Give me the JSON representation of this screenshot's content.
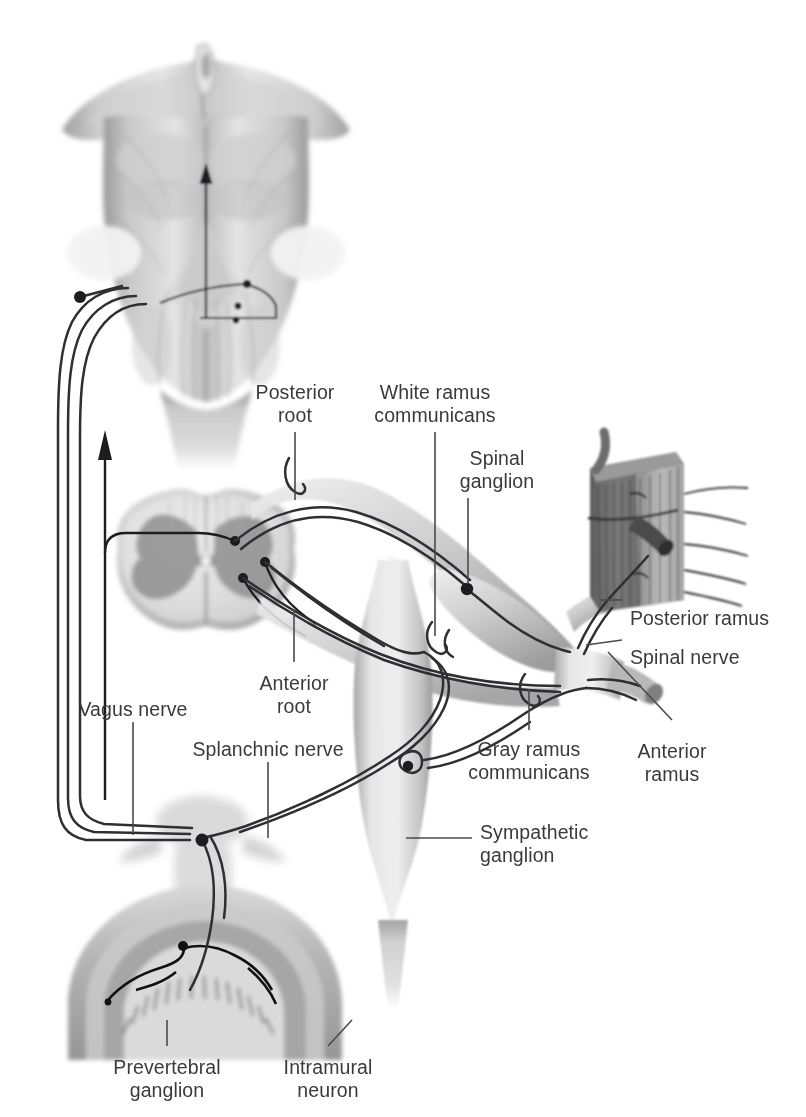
{
  "figure": {
    "background_color": "#ffffff",
    "label_color": "#3a3a3c",
    "leader_color": "#4a4a4c",
    "nerve_color": "#2f2f33",
    "tissue_light": "#dcdcdc",
    "tissue_mid": "#b9b9b9",
    "tissue_dark": "#8a8a8a"
  },
  "labels": [
    {
      "id": "posterior-root",
      "lines": [
        "Posterior",
        "root"
      ],
      "x": 295,
      "y": 381,
      "align": "center"
    },
    {
      "id": "white-ramus",
      "lines": [
        "White ramus",
        "communicans"
      ],
      "x": 435,
      "y": 381,
      "align": "center"
    },
    {
      "id": "spinal-ganglion",
      "lines": [
        "Spinal",
        "ganglion"
      ],
      "x": 497,
      "y": 447,
      "align": "center"
    },
    {
      "id": "posterior-ramus",
      "lines": [
        "Posterior ramus"
      ],
      "x": 630,
      "y": 607,
      "align": "left"
    },
    {
      "id": "spinal-nerve",
      "lines": [
        "Spinal nerve"
      ],
      "x": 630,
      "y": 646,
      "align": "left"
    },
    {
      "id": "anterior-ramus",
      "lines": [
        "Anterior",
        "ramus"
      ],
      "x": 672,
      "y": 740,
      "align": "center"
    },
    {
      "id": "gray-ramus",
      "lines": [
        "Gray ramus",
        "communicans"
      ],
      "x": 529,
      "y": 738,
      "align": "center"
    },
    {
      "id": "sympathetic-ganglion",
      "lines": [
        "Sympathetic",
        "ganglion"
      ],
      "x": 480,
      "y": 821,
      "align": "left"
    },
    {
      "id": "anterior-root",
      "lines": [
        "Anterior",
        "root"
      ],
      "x": 294,
      "y": 672,
      "align": "center"
    },
    {
      "id": "vagus-nerve",
      "lines": [
        "Vagus nerve"
      ],
      "x": 133,
      "y": 698,
      "align": "center"
    },
    {
      "id": "splanchnic-nerve",
      "lines": [
        "Splanchnic nerve"
      ],
      "x": 268,
      "y": 738,
      "align": "center"
    },
    {
      "id": "prevertebral-ganglion",
      "lines": [
        "Prevertebral",
        "ganglion"
      ],
      "x": 167,
      "y": 1056,
      "align": "center"
    },
    {
      "id": "intramural-neuron",
      "lines": [
        "Intramural",
        "neuron"
      ],
      "x": 328,
      "y": 1056,
      "align": "center"
    }
  ],
  "leaders": [
    {
      "id": "leader-posterior-root",
      "points": "295,432 295,500"
    },
    {
      "id": "leader-white-ramus",
      "points": "435,432 435,636"
    },
    {
      "id": "leader-spinal-ganglion",
      "points": "468,498 468,584"
    },
    {
      "id": "leader-posterior-ramus",
      "points": "600,600 622,600"
    },
    {
      "id": "leader-spinal-nerve",
      "points": "586,645 622,640"
    },
    {
      "id": "leader-anterior-ramus",
      "points": "608,652 672,720"
    },
    {
      "id": "leader-gray-ramus",
      "points": "529,689 529,730"
    },
    {
      "id": "leader-sympathetic-ganglion",
      "points": "406,838 472,838"
    },
    {
      "id": "leader-anterior-root",
      "points": "294,610 294,662"
    },
    {
      "id": "leader-vagus-nerve",
      "points": "133,722 133,835"
    },
    {
      "id": "leader-splanchnic-nerve",
      "points": "268,762 268,838"
    },
    {
      "id": "leader-prevertebral-ganglion",
      "points": "167,1020 167,1046"
    },
    {
      "id": "leader-intramural-neuron",
      "points": "352,1020 328,1046"
    }
  ],
  "structures": [
    {
      "id": "brainstem",
      "name": "brainstem-illustration"
    },
    {
      "id": "spinal-cord",
      "name": "spinal-cord-cross-section"
    },
    {
      "id": "spinal-ganglion-body",
      "name": "spinal-ganglion-structure"
    },
    {
      "id": "sympathetic-trunk",
      "name": "sympathetic-trunk-structure"
    },
    {
      "id": "muscle-inset",
      "name": "skeletal-muscle-inset"
    },
    {
      "id": "gut-wall",
      "name": "intestinal-wall-structure"
    },
    {
      "id": "vertebra",
      "name": "vertebra-structure"
    }
  ],
  "markers": [
    {
      "id": "vagus-origin-neuron",
      "cx": 80,
      "cy": 297
    },
    {
      "id": "posterior-horn-neuron",
      "cx": 235,
      "cy": 541
    },
    {
      "id": "lateral-horn-neuron",
      "cx": 265,
      "cy": 562
    },
    {
      "id": "anterior-horn-neuron",
      "cx": 243,
      "cy": 578
    },
    {
      "id": "spinal-ganglion-neuron",
      "cx": 467,
      "cy": 589
    },
    {
      "id": "sympathetic-synapse",
      "cx": 408,
      "cy": 766
    },
    {
      "id": "prevertebral-synapse",
      "cx": 202,
      "cy": 840
    },
    {
      "id": "intramural-synapse",
      "cx": 183,
      "cy": 936
    }
  ],
  "arrows": [
    {
      "id": "ascending-afferent-arrow-cord",
      "from": [
        105,
        800
      ],
      "to": [
        105,
        432
      ]
    },
    {
      "id": "ascending-afferent-arrow-brainstem",
      "from": [
        206,
        290
      ],
      "to": [
        206,
        165
      ]
    }
  ]
}
